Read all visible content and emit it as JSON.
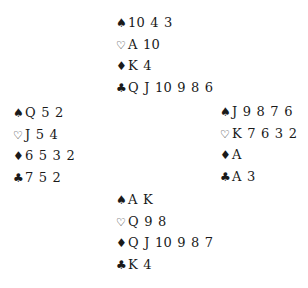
{
  "deal": {
    "north": {
      "spades": "10 4 3",
      "hearts": "A 10",
      "diamonds": "K 4",
      "clubs": "Q J 10 9 8 6"
    },
    "west": {
      "spades": "Q 5 2",
      "hearts": "J 5 4",
      "diamonds": "6 5 3 2",
      "clubs": "7 5 2"
    },
    "east": {
      "spades": "J 9 8 7 6",
      "hearts": "K 7 6 3 2",
      "diamonds": "A",
      "clubs": "A 3"
    },
    "south": {
      "spades": "A K",
      "hearts": "Q 9 8",
      "diamonds": "Q J 10 9 8 7",
      "clubs": "K 4"
    }
  },
  "suit_symbols": {
    "spades": "♠",
    "hearts": "♡",
    "diamonds": "♦",
    "clubs": "♣"
  }
}
